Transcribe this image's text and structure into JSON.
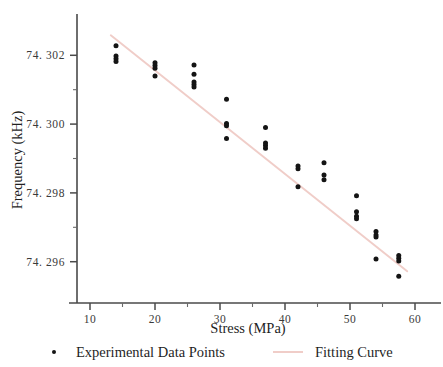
{
  "chart_data": {
    "type": "scatter",
    "title": "",
    "xlabel": "Stress (MPa)",
    "ylabel": "Frequency (kHz)",
    "xlim": [
      8,
      64
    ],
    "ylim": [
      74.2948,
      74.3032
    ],
    "grid": false,
    "xticks": [
      10,
      20,
      30,
      40,
      50,
      60
    ],
    "xticklabels": [
      "10",
      "20",
      "30",
      "40",
      "50",
      "60"
    ],
    "xminorticks": [
      15,
      25,
      35,
      45,
      55
    ],
    "yticks": [
      74.296,
      74.298,
      74.3,
      74.302
    ],
    "yticklabels": [
      "74. 296",
      "74. 298",
      "74. 300",
      "74. 302"
    ],
    "yminorticks": [
      74.297,
      74.299,
      74.301
    ],
    "legend_position": "below-axes",
    "series": [
      {
        "name": "Experimental Data Points",
        "type": "scatter",
        "marker": "circle",
        "color": "#141414",
        "points": [
          [
            14.0,
            74.30228
          ],
          [
            14.0,
            74.30198
          ],
          [
            14.0,
            74.3019
          ],
          [
            14.0,
            74.30182
          ],
          [
            20.0,
            74.30178
          ],
          [
            20.0,
            74.3017
          ],
          [
            20.0,
            74.30162
          ],
          [
            20.0,
            74.3014
          ],
          [
            26.0,
            74.30172
          ],
          [
            26.0,
            74.30145
          ],
          [
            26.0,
            74.30122
          ],
          [
            26.0,
            74.30115
          ],
          [
            26.0,
            74.30108
          ],
          [
            31.0,
            74.30072
          ],
          [
            31.0,
            74.30002
          ],
          [
            31.0,
            74.29995
          ],
          [
            31.0,
            74.29958
          ],
          [
            37.0,
            74.2999
          ],
          [
            37.0,
            74.29945
          ],
          [
            37.0,
            74.29938
          ],
          [
            37.0,
            74.2993
          ],
          [
            42.0,
            74.29878
          ],
          [
            42.0,
            74.2987
          ],
          [
            42.0,
            74.29818
          ],
          [
            46.0,
            74.29888
          ],
          [
            46.0,
            74.29852
          ],
          [
            46.0,
            74.29838
          ],
          [
            51.0,
            74.29792
          ],
          [
            51.0,
            74.29745
          ],
          [
            51.0,
            74.29732
          ],
          [
            51.0,
            74.29725
          ],
          [
            54.0,
            74.29688
          ],
          [
            54.0,
            74.29678
          ],
          [
            54.0,
            74.29672
          ],
          [
            54.0,
            74.29608
          ],
          [
            57.5,
            74.29618
          ],
          [
            57.5,
            74.2961
          ],
          [
            57.5,
            74.29602
          ],
          [
            57.5,
            74.29558
          ]
        ]
      },
      {
        "name": "Fitting Curve",
        "type": "line",
        "color": "#f0cdc8",
        "endpoints": [
          [
            13.2,
            74.30258
          ],
          [
            58.8,
            74.29572
          ]
        ]
      }
    ]
  },
  "legend": {
    "points_label": "Experimental Data Points",
    "fit_label": "Fitting Curve"
  },
  "colors": {
    "marker": "#141414",
    "fit_line": "#f0cdc8",
    "axis": "#4a4a4a",
    "text": "#1f1f1f"
  }
}
